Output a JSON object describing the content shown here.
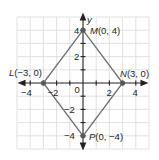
{
  "diagram": {
    "type": "coordinate-plane",
    "shape": "rhombus",
    "axes": {
      "x_label": "",
      "y_label": "y",
      "x_ticks": [
        {
          "value": -4,
          "label": "−4"
        },
        {
          "value": -2,
          "label": "−2"
        },
        {
          "value": 2,
          "label": "2"
        },
        {
          "value": 4,
          "label": "4"
        }
      ],
      "y_ticks": [
        {
          "value": 4,
          "label": "4"
        },
        {
          "value": 2,
          "label": "2"
        },
        {
          "value": -2,
          "label": "−2"
        },
        {
          "value": -4,
          "label": "−4"
        }
      ],
      "origin_label": "0",
      "range": [
        -5,
        5
      ]
    },
    "points": [
      {
        "name": "M",
        "x": 0,
        "y": 4,
        "label": "M(0, 4)",
        "letter": "M",
        "coords": "(0, 4)"
      },
      {
        "name": "N",
        "x": 3,
        "y": 0,
        "label": "N(3, 0)",
        "letter": "N",
        "coords": "(3, 0)"
      },
      {
        "name": "P",
        "x": 0,
        "y": -4,
        "label": "P(0, −4)",
        "letter": "P",
        "coords": "(0, −4)"
      },
      {
        "name": "L",
        "x": -3,
        "y": 0,
        "label": "L(−3, 0)",
        "letter": "L",
        "coords": "(−3, 0)"
      }
    ],
    "colors": {
      "grid": "#d9d9d9",
      "axis": "#231f20",
      "shape_stroke": "#6d6e71",
      "point": "#58595b",
      "text": "#231f20"
    }
  }
}
